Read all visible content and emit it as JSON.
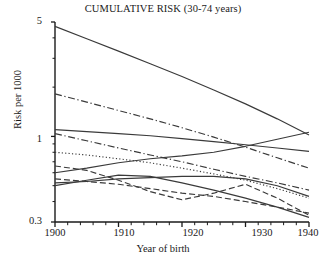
{
  "chart_data": {
    "type": "line",
    "title": "CUMULATIVE RISK (30-74 years)",
    "xlabel": "Year of birth",
    "ylabel": "Risk per 1000",
    "xlim": [
      1900,
      1940
    ],
    "ylim": [
      0.3,
      5
    ],
    "yscale": "log",
    "grid": false,
    "legend": "none",
    "xticks_major": [
      1900,
      1910,
      1920,
      1930,
      1940
    ],
    "xtick_labels": [
      "1900",
      "1910",
      "1920",
      "1930",
      "1940"
    ],
    "xticks_minor_step": 2,
    "yticks_major": [
      5,
      1,
      0.3
    ],
    "ytick_labels": [
      "5",
      "1",
      "0.3"
    ],
    "yticks_minor": [
      4,
      3,
      2,
      0.9,
      0.8,
      0.7,
      0.6,
      0.5,
      0.4
    ],
    "x": [
      1900,
      1905,
      1910,
      1915,
      1920,
      1925,
      1930,
      1935,
      1940
    ],
    "series": [
      {
        "name": "series-1",
        "style": "solid",
        "values": [
          4.7,
          3.95,
          3.32,
          2.78,
          2.32,
          1.92,
          1.58,
          1.28,
          1.02
        ]
      },
      {
        "name": "series-2",
        "style": "dashdot",
        "values": [
          1.82,
          1.62,
          1.44,
          1.28,
          1.13,
          0.99,
          0.86,
          0.74,
          0.64
        ]
      },
      {
        "name": "series-3",
        "style": "solid",
        "values": [
          1.1,
          1.07,
          1.04,
          1.01,
          0.97,
          0.93,
          0.89,
          0.85,
          0.81
        ]
      },
      {
        "name": "series-4",
        "style": "dashdot",
        "values": [
          1.04,
          0.94,
          0.85,
          0.77,
          0.7,
          0.63,
          0.57,
          0.52,
          0.47
        ]
      },
      {
        "name": "series-5",
        "style": "dotted",
        "values": [
          0.8,
          0.77,
          0.73,
          0.69,
          0.64,
          0.59,
          0.54,
          0.48,
          0.42
        ]
      },
      {
        "name": "series-6",
        "style": "solid",
        "values": [
          0.6,
          0.64,
          0.69,
          0.73,
          0.76,
          0.8,
          0.87,
          0.96,
          1.06
        ]
      },
      {
        "name": "series-7",
        "style": "solid",
        "values": [
          0.52,
          0.53,
          0.55,
          0.56,
          0.57,
          0.57,
          0.55,
          0.5,
          0.43
        ]
      },
      {
        "name": "series-8",
        "style": "dashed",
        "values": [
          0.66,
          0.62,
          0.54,
          0.46,
          0.41,
          0.45,
          0.51,
          0.42,
          0.33
        ]
      },
      {
        "name": "series-9",
        "style": "dashed",
        "values": [
          0.55,
          0.53,
          0.51,
          0.48,
          0.45,
          0.43,
          0.4,
          0.37,
          0.34
        ]
      },
      {
        "name": "series-10",
        "style": "solid",
        "values": [
          0.5,
          0.54,
          0.58,
          0.57,
          0.52,
          0.47,
          0.42,
          0.37,
          0.32
        ]
      }
    ]
  },
  "axis": {
    "y_label": "Risk per 1000",
    "x_label": "Year of birth",
    "y_tick_0": "5",
    "y_tick_1": "1",
    "y_tick_2": "0.3",
    "x_tick_0": "1900",
    "x_tick_1": "1910",
    "x_tick_2": "1920",
    "x_tick_3": "1930",
    "x_tick_4": "1940"
  },
  "style": {
    "line_color": "#3a3a3a",
    "axis_color": "#1a1a1a",
    "background": "#ffffff"
  }
}
